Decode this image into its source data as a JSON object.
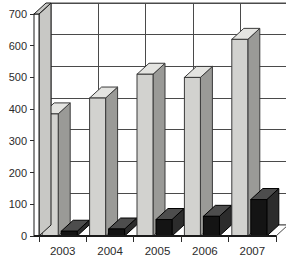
{
  "chart_data": {
    "type": "bar",
    "title": "",
    "subtitle": "",
    "xlabel": "",
    "ylabel": "",
    "categories": [
      "2003",
      "2004",
      "2005",
      "2006",
      "2007"
    ],
    "series": [
      {
        "name": "Series 1",
        "color": "#d2d2cf",
        "values": [
          385,
          435,
          510,
          500,
          620
        ]
      },
      {
        "name": "Series 2",
        "color": "#141414",
        "values": [
          15,
          22,
          52,
          62,
          115
        ]
      }
    ],
    "ylim": [
      0,
      700
    ],
    "yticks": [
      0,
      100,
      200,
      300,
      400,
      500,
      600,
      700
    ],
    "ytick_labels": [
      "0",
      "100",
      "200",
      "300",
      "400",
      "500",
      "600",
      "700"
    ],
    "grid": true,
    "grid_axis": "y",
    "legend": false,
    "legend_position": "none",
    "style": "3d-perspective-column",
    "annotations": []
  },
  "axis": {
    "y_labels": [
      "700",
      "600",
      "500",
      "400",
      "300",
      "200",
      "100",
      "0"
    ],
    "x_labels": [
      "2003",
      "2004",
      "2005",
      "2006",
      "2007"
    ]
  }
}
